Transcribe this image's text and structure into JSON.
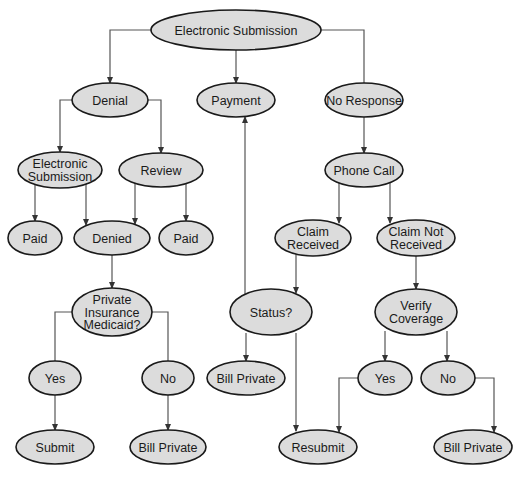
{
  "diagram": {
    "type": "flowchart",
    "colors": {
      "node_fill": "#dcdcdc",
      "node_stroke": "#1a1a1a",
      "edge": "#555555",
      "background": "#ffffff"
    },
    "nodes": [
      {
        "id": "root",
        "lines": [
          "Electronic Submission"
        ],
        "cx": 236,
        "cy": 30,
        "rx": 85,
        "ry": 20
      },
      {
        "id": "denial",
        "lines": [
          "Denial"
        ],
        "cx": 110,
        "cy": 100,
        "rx": 38,
        "ry": 17
      },
      {
        "id": "payment",
        "lines": [
          "Payment"
        ],
        "cx": 236,
        "cy": 100,
        "rx": 39,
        "ry": 17
      },
      {
        "id": "no_response",
        "lines": [
          "No Response"
        ],
        "cx": 364,
        "cy": 100,
        "rx": 39,
        "ry": 17
      },
      {
        "id": "electronic_submission_2",
        "lines": [
          "Electronic",
          "Submission"
        ],
        "cx": 60,
        "cy": 170,
        "rx": 42,
        "ry": 18
      },
      {
        "id": "review",
        "lines": [
          "Review"
        ],
        "cx": 161,
        "cy": 170,
        "rx": 42,
        "ry": 17
      },
      {
        "id": "phone_call",
        "lines": [
          "Phone Call"
        ],
        "cx": 364,
        "cy": 170,
        "rx": 39,
        "ry": 17
      },
      {
        "id": "paid_1",
        "lines": [
          "Paid"
        ],
        "cx": 35,
        "cy": 238,
        "rx": 27,
        "ry": 17
      },
      {
        "id": "denied",
        "lines": [
          "Denied"
        ],
        "cx": 112,
        "cy": 238,
        "rx": 38,
        "ry": 17
      },
      {
        "id": "paid_2",
        "lines": [
          "Paid"
        ],
        "cx": 186,
        "cy": 238,
        "rx": 27,
        "ry": 17
      },
      {
        "id": "claim_received",
        "lines": [
          "Claim",
          "Received"
        ],
        "cx": 313,
        "cy": 238,
        "rx": 38,
        "ry": 18
      },
      {
        "id": "claim_not_received",
        "lines": [
          "Claim Not",
          "Received"
        ],
        "cx": 416,
        "cy": 238,
        "rx": 39,
        "ry": 18
      },
      {
        "id": "private_insurance",
        "lines": [
          "Private",
          "Insurance",
          "Medicaid?"
        ],
        "cx": 112,
        "cy": 312,
        "rx": 40,
        "ry": 24
      },
      {
        "id": "status",
        "lines": [
          "Status?"
        ],
        "cx": 271,
        "cy": 312,
        "rx": 41,
        "ry": 23
      },
      {
        "id": "verify_coverage",
        "lines": [
          "Verify",
          "Coverage"
        ],
        "cx": 416,
        "cy": 312,
        "rx": 41,
        "ry": 23
      },
      {
        "id": "yes_1",
        "lines": [
          "Yes"
        ],
        "cx": 55,
        "cy": 378,
        "rx": 26,
        "ry": 17
      },
      {
        "id": "no_1",
        "lines": [
          "No"
        ],
        "cx": 168,
        "cy": 378,
        "rx": 26,
        "ry": 17
      },
      {
        "id": "bill_private_center",
        "lines": [
          "Bill Private"
        ],
        "cx": 246,
        "cy": 378,
        "rx": 39,
        "ry": 17
      },
      {
        "id": "yes_2",
        "lines": [
          "Yes"
        ],
        "cx": 385,
        "cy": 378,
        "rx": 27,
        "ry": 17
      },
      {
        "id": "no_2",
        "lines": [
          "No"
        ],
        "cx": 448,
        "cy": 378,
        "rx": 27,
        "ry": 17
      },
      {
        "id": "submit",
        "lines": [
          "Submit"
        ],
        "cx": 55,
        "cy": 447,
        "rx": 39,
        "ry": 17
      },
      {
        "id": "bill_private_left",
        "lines": [
          "Bill Private"
        ],
        "cx": 168,
        "cy": 447,
        "rx": 38,
        "ry": 17
      },
      {
        "id": "resubmit",
        "lines": [
          "Resubmit"
        ],
        "cx": 318,
        "cy": 447,
        "rx": 39,
        "ry": 17
      },
      {
        "id": "bill_private_right",
        "lines": [
          "Bill Private"
        ],
        "cx": 473,
        "cy": 447,
        "rx": 39,
        "ry": 17
      }
    ],
    "edges": [
      {
        "from": "root",
        "to": "denial",
        "arrow": true,
        "points": [
          [
            151,
            30
          ],
          [
            110,
            30
          ],
          [
            110,
            83
          ]
        ]
      },
      {
        "from": "root",
        "to": "payment",
        "arrow": true,
        "points": [
          [
            236,
            50
          ],
          [
            236,
            83
          ]
        ]
      },
      {
        "from": "root",
        "to": "no_response",
        "arrow": false,
        "points": [
          [
            321,
            30
          ],
          [
            364,
            30
          ],
          [
            364,
            83
          ]
        ]
      },
      {
        "from": "denial",
        "to": "electronic_submission_2",
        "arrow": true,
        "points": [
          [
            72,
            100
          ],
          [
            60,
            100
          ],
          [
            60,
            152
          ]
        ]
      },
      {
        "from": "denial",
        "to": "review",
        "arrow": true,
        "points": [
          [
            148,
            100
          ],
          [
            161,
            100
          ],
          [
            161,
            153
          ]
        ]
      },
      {
        "from": "no_response",
        "to": "phone_call",
        "arrow": true,
        "points": [
          [
            364,
            117
          ],
          [
            364,
            153
          ]
        ]
      },
      {
        "from": "electronic_submission_2",
        "to": "paid_1",
        "arrow": true,
        "points": [
          [
            35,
            185
          ],
          [
            35,
            221
          ]
        ]
      },
      {
        "from": "electronic_submission_2",
        "to": "denied",
        "arrow": true,
        "points": [
          [
            86,
            184
          ],
          [
            86,
            225
          ]
        ]
      },
      {
        "from": "review",
        "to": "denied",
        "arrow": true,
        "points": [
          [
            135,
            183
          ],
          [
            135,
            224
          ]
        ]
      },
      {
        "from": "review",
        "to": "paid_2",
        "arrow": true,
        "points": [
          [
            186,
            184
          ],
          [
            186,
            221
          ]
        ]
      },
      {
        "from": "phone_call",
        "to": "claim_received",
        "arrow": true,
        "points": [
          [
            339,
            183
          ],
          [
            339,
            223
          ]
        ]
      },
      {
        "from": "phone_call",
        "to": "claim_not_received",
        "arrow": true,
        "points": [
          [
            390,
            183
          ],
          [
            390,
            223
          ]
        ]
      },
      {
        "from": "denied",
        "to": "private_insurance",
        "arrow": true,
        "points": [
          [
            112,
            255
          ],
          [
            112,
            288
          ]
        ]
      },
      {
        "from": "claim_received",
        "to": "status",
        "arrow": true,
        "points": [
          [
            296,
            254
          ],
          [
            296,
            293
          ]
        ]
      },
      {
        "from": "claim_not_received",
        "to": "verify_coverage",
        "arrow": true,
        "points": [
          [
            416,
            256
          ],
          [
            416,
            289
          ]
        ]
      },
      {
        "from": "status",
        "to": "payment",
        "arrow": true,
        "points": [
          [
            245,
            294
          ],
          [
            245,
            117
          ]
        ]
      },
      {
        "from": "private_insurance",
        "to": "yes_1",
        "arrow": false,
        "points": [
          [
            72,
            312
          ],
          [
            55,
            312
          ],
          [
            55,
            361
          ]
        ]
      },
      {
        "from": "private_insurance",
        "to": "no_1",
        "arrow": false,
        "points": [
          [
            152,
            312
          ],
          [
            168,
            312
          ],
          [
            168,
            361
          ]
        ]
      },
      {
        "from": "status",
        "to": "bill_private_center",
        "arrow": true,
        "points": [
          [
            246,
            333
          ],
          [
            246,
            361
          ]
        ]
      },
      {
        "from": "status",
        "to": "resubmit",
        "arrow": true,
        "points": [
          [
            296,
            333
          ],
          [
            296,
            431
          ]
        ]
      },
      {
        "from": "verify_coverage",
        "to": "yes_2",
        "arrow": true,
        "points": [
          [
            385,
            331
          ],
          [
            385,
            361
          ]
        ]
      },
      {
        "from": "verify_coverage",
        "to": "no_2",
        "arrow": true,
        "points": [
          [
            447,
            331
          ],
          [
            447,
            361
          ]
        ]
      },
      {
        "from": "yes_1",
        "to": "submit",
        "arrow": true,
        "points": [
          [
            55,
            395
          ],
          [
            55,
            430
          ]
        ]
      },
      {
        "from": "no_1",
        "to": "bill_private_left",
        "arrow": true,
        "points": [
          [
            168,
            395
          ],
          [
            168,
            430
          ]
        ]
      },
      {
        "from": "yes_2",
        "to": "resubmit",
        "arrow": true,
        "points": [
          [
            358,
            378
          ],
          [
            339,
            378
          ],
          [
            339,
            432
          ]
        ]
      },
      {
        "from": "no_2",
        "to": "bill_private_right",
        "arrow": true,
        "points": [
          [
            475,
            378
          ],
          [
            494,
            378
          ],
          [
            494,
            432
          ]
        ]
      }
    ]
  }
}
